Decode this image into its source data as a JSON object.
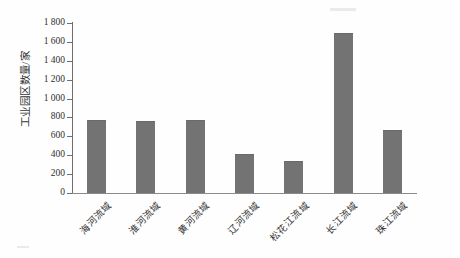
{
  "chart_data": {
    "type": "bar",
    "title": "",
    "subtitle": "",
    "xlabel": "",
    "ylabel": "工业园区数量/家",
    "categories": [
      "海河流域",
      "淮河流域",
      "黄河流域",
      "辽河流域",
      "松花江流域",
      "长江流域",
      "珠江流域"
    ],
    "values": [
      760,
      755,
      765,
      400,
      330,
      1680,
      660
    ],
    "series": [
      {
        "name": "工业园区数量",
        "values": [
          760,
          755,
          765,
          400,
          330,
          1680,
          660
        ]
      }
    ],
    "ylim": [
      0,
      1800
    ],
    "ytick_labels": [
      "0",
      "200",
      "400",
      "600",
      "800",
      "1 000",
      "1 200",
      "1 400",
      "1 600",
      "1 800"
    ],
    "ytick_values": [
      0,
      200,
      400,
      600,
      800,
      1000,
      1200,
      1400,
      1600,
      1800
    ],
    "grid": false,
    "legend": null,
    "legend_position": "none",
    "bar_color": "#737373",
    "axis_color": "#6f6f6f",
    "background_color": "#ffffff",
    "annotations": [],
    "xtick_rotation": -45
  },
  "figure": {
    "caption": "",
    "source_note": ""
  }
}
